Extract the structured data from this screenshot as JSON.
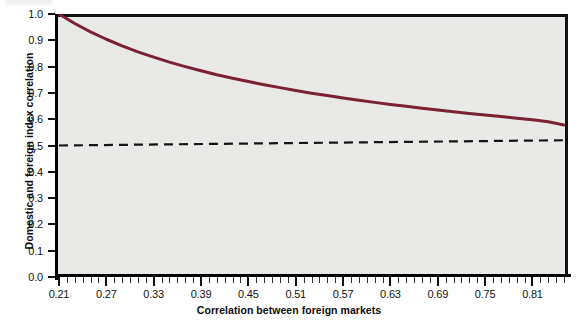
{
  "chart_data": {
    "type": "line",
    "title": "",
    "xlabel": "Correlation between foreign markets",
    "ylabel": "Domestic and foreign index correlation",
    "xlim": [
      0.205,
      0.855
    ],
    "ylim": [
      0.0,
      1.0
    ],
    "grid": false,
    "legend": null,
    "plot_background": "#e9e9e7",
    "page_background": "#ffffff",
    "x_tick_labels": [
      "0.21",
      "0.27",
      "0.33",
      "0.39",
      "0.45",
      "0.51",
      "0.57",
      "0.63",
      "0.69",
      "0.75",
      "0.81"
    ],
    "x_tick_values": [
      0.21,
      0.27,
      0.33,
      0.39,
      0.45,
      0.51,
      0.57,
      0.63,
      0.69,
      0.75,
      0.81
    ],
    "x_minor_tick_step": 0.01,
    "y_tick_labels": [
      "0.0",
      "0.1",
      "0.2",
      "0.3",
      "0.4",
      "0.5",
      "0.6",
      "0.7",
      "0.8",
      "0.9",
      "1.0"
    ],
    "y_tick_values": [
      0.0,
      0.1,
      0.2,
      0.3,
      0.4,
      0.5,
      0.6,
      0.7,
      0.8,
      0.9,
      1.0
    ],
    "series": [
      {
        "name": "Domestic and foreign index correlation",
        "style": "solid",
        "color": "#7a2133",
        "width": 2.6,
        "x": [
          0.21,
          0.23,
          0.25,
          0.27,
          0.29,
          0.31,
          0.33,
          0.35,
          0.37,
          0.39,
          0.41,
          0.43,
          0.45,
          0.47,
          0.49,
          0.51,
          0.53,
          0.55,
          0.57,
          0.59,
          0.61,
          0.63,
          0.65,
          0.67,
          0.69,
          0.71,
          0.73,
          0.75,
          0.77,
          0.79,
          0.81,
          0.83,
          0.85
        ],
        "y": [
          1.0,
          0.964,
          0.932,
          0.904,
          0.879,
          0.856,
          0.836,
          0.817,
          0.8,
          0.784,
          0.769,
          0.756,
          0.743,
          0.731,
          0.72,
          0.709,
          0.699,
          0.69,
          0.681,
          0.672,
          0.664,
          0.656,
          0.649,
          0.642,
          0.635,
          0.628,
          0.622,
          0.616,
          0.61,
          0.604,
          0.598,
          0.59,
          0.578
        ]
      },
      {
        "name": "reference-level",
        "style": "dashed",
        "color": "#151515",
        "width": 2.0,
        "x": [
          0.21,
          0.85
        ],
        "y": [
          0.5,
          0.52
        ]
      }
    ]
  },
  "axes": {
    "y_axis_title": "Domestic and foreign index correlation",
    "x_axis_title": "Correlation between foreign markets"
  }
}
